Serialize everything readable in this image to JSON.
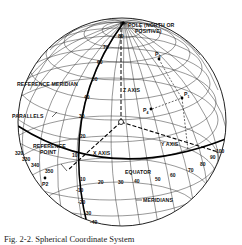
{
  "figure": {
    "labels": {
      "pole": "POLE (NORTH OR",
      "pole_line2": "POSITIVE)",
      "reference_meridian": "REFERENCE MERIDIAN",
      "parallels": "PARALLELS",
      "reference_point": "REFERENCE",
      "reference_point_line2": "POINT",
      "x_axis": "X AXIS",
      "y_axis": "Y AXIS",
      "z_axis": "Z AXIS",
      "equator": "EQUATOR",
      "meridians": "MERIDIANS"
    },
    "points": {
      "p1": "P",
      "p1_sub": "1",
      "p2": "P2",
      "p3": "P",
      "p3_sub": "3",
      "p4": "P",
      "p4_sub": "4"
    },
    "meridian_ticks": [
      "80",
      "70",
      "60",
      "50",
      "40",
      "30",
      "20",
      "10",
      "-10",
      "-20",
      "-30",
      "-40"
    ],
    "equator_ticks_east": [
      "10",
      "20",
      "30",
      "40",
      "50",
      "60",
      "70",
      "80",
      "90",
      "100"
    ],
    "equator_ticks_west": [
      "320",
      "330",
      "340",
      "350"
    ],
    "caption": "Fig. 2-2.   Spherical Coordinate System"
  }
}
